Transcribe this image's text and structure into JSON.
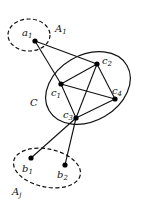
{
  "diagram": {
    "type": "graph",
    "groups": [
      {
        "id": "A1",
        "label": "A",
        "sub": "1",
        "style": "dashed",
        "cx": 29,
        "cy": 35,
        "rx": 21,
        "ry": 16,
        "rotate": 0,
        "label_x": 55,
        "label_y": 32
      },
      {
        "id": "C",
        "label": "C",
        "sub": "",
        "style": "solid",
        "cx": 88,
        "cy": 88,
        "rx": 45,
        "ry": 33,
        "rotate": -30,
        "label_x": 30,
        "label_y": 106
      },
      {
        "id": "Aj",
        "label": "A",
        "sub": "j",
        "style": "dashed",
        "cx": 47,
        "cy": 168,
        "rx": 34,
        "ry": 19,
        "rotate": 12,
        "label_x": 12,
        "label_y": 195
      }
    ],
    "nodes": [
      {
        "id": "a1",
        "label": "a",
        "sub": "1",
        "x": 35,
        "y": 41,
        "lx": 22,
        "ly": 36
      },
      {
        "id": "c1",
        "label": "c",
        "sub": "1",
        "x": 61,
        "y": 84,
        "lx": 51,
        "ly": 96
      },
      {
        "id": "c2",
        "label": "c",
        "sub": "2",
        "x": 97,
        "y": 64,
        "lx": 102,
        "ly": 64
      },
      {
        "id": "c3",
        "label": "c",
        "sub": "3",
        "x": 76,
        "y": 118,
        "lx": 63,
        "ly": 118
      },
      {
        "id": "c4",
        "label": "c",
        "sub": "4",
        "x": 115,
        "y": 99,
        "lx": 112,
        "ly": 94
      },
      {
        "id": "b1",
        "label": "b",
        "sub": "1",
        "x": 31,
        "y": 158,
        "lx": 22,
        "ly": 172
      },
      {
        "id": "b2",
        "label": "b",
        "sub": "2",
        "x": 65,
        "y": 165,
        "lx": 57,
        "ly": 178
      }
    ],
    "edges": [
      [
        "a1",
        "c1"
      ],
      [
        "a1",
        "c2"
      ],
      [
        "c1",
        "c2"
      ],
      [
        "c1",
        "c3"
      ],
      [
        "c1",
        "c4"
      ],
      [
        "c2",
        "c3"
      ],
      [
        "c2",
        "c4"
      ],
      [
        "c3",
        "c4"
      ],
      [
        "c3",
        "b1"
      ],
      [
        "c3",
        "b2"
      ]
    ]
  }
}
